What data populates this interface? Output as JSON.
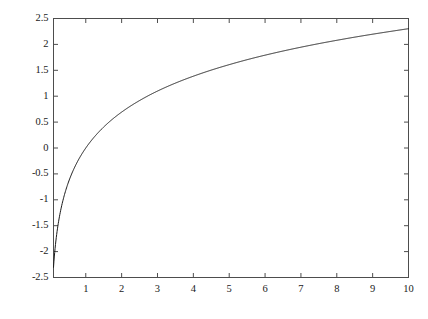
{
  "figure": {
    "background_color": "#ffffff",
    "frame_color": "#4d4d4d",
    "curve_color": "#1a1a1a",
    "tick_color": "#4d4d4d",
    "label_color": "#1a1a1a"
  },
  "chart_data": {
    "type": "line",
    "title": "",
    "subtitle": "",
    "xlabel": "",
    "ylabel": "",
    "xlim": [
      0.1,
      10
    ],
    "ylim": [
      -2.5,
      2.5
    ],
    "grid": false,
    "legend": null,
    "legend_position": "none",
    "xticks": [
      1,
      2,
      3,
      4,
      5,
      6,
      7,
      8,
      9,
      10
    ],
    "xtick_labels": [
      "1",
      "2",
      "3",
      "4",
      "5",
      "6",
      "7",
      "8",
      "9",
      "10"
    ],
    "yticks": [
      -2.5,
      -2,
      -1.5,
      -1,
      -0.5,
      0,
      0.5,
      1,
      1.5,
      2,
      2.5
    ],
    "ytick_labels": [
      "-2.5",
      "-2",
      "-1.5",
      "-1",
      "-0.5",
      "0",
      "0.5",
      "1",
      "1.5",
      "2",
      "2.5"
    ],
    "series": [
      {
        "name": "ln(x)",
        "color": "#1a1a1a",
        "line_width": 1,
        "x": [
          0.1,
          0.15,
          0.2,
          0.25,
          0.3,
          0.35,
          0.4,
          0.45,
          0.5,
          0.6,
          0.7,
          0.8,
          0.9,
          1.0,
          1.2,
          1.4,
          1.6,
          1.8,
          2.0,
          2.25,
          2.5,
          2.75,
          3.0,
          3.5,
          4.0,
          4.5,
          5.0,
          5.5,
          6.0,
          6.5,
          7.0,
          7.5,
          8.0,
          8.5,
          9.0,
          9.5,
          10.0
        ],
        "y": [
          -2.303,
          -1.897,
          -1.609,
          -1.386,
          -1.204,
          -1.05,
          -0.916,
          -0.799,
          -0.693,
          -0.511,
          -0.357,
          -0.223,
          -0.105,
          0.0,
          0.182,
          0.336,
          0.47,
          0.588,
          0.693,
          0.811,
          0.916,
          1.012,
          1.099,
          1.253,
          1.386,
          1.504,
          1.609,
          1.705,
          1.792,
          1.872,
          1.946,
          2.015,
          2.079,
          2.14,
          2.197,
          2.251,
          2.303
        ]
      }
    ]
  }
}
